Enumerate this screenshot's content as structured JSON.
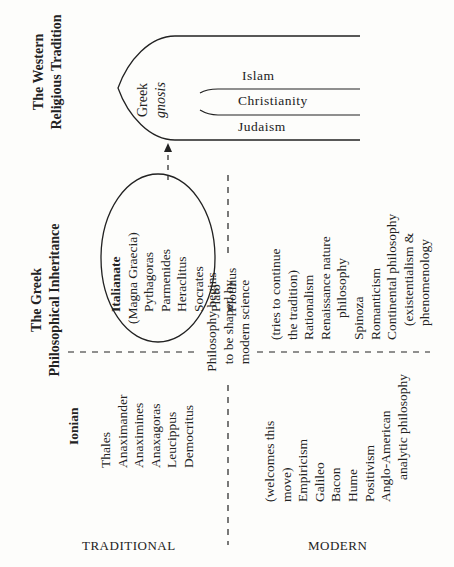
{
  "western": {
    "title_line1": "The Western",
    "title_line2": "Religious Tradition",
    "gnosis_line1": "Greek",
    "gnosis_line2": "gnosis",
    "religions": [
      "Islam",
      "Christianity",
      "Judaism"
    ]
  },
  "greek": {
    "title_line1": "The Greek",
    "title_line2": "Philosophical Inheritance",
    "italianate": {
      "heading": "Italianate",
      "subheading": "(Magna Graecia)",
      "names": [
        "Pythagoras",
        "Parmenides",
        "Heraclitus",
        "Socrates",
        "Plato",
        "Plotinus"
      ]
    },
    "ionian": {
      "heading": "Ionian",
      "names": [
        "Thales",
        "Anaximander",
        "Anaximines",
        "Anaxagoras",
        "Leucippus",
        "Democritus"
      ]
    }
  },
  "divider": {
    "line1": "Philosophy begins",
    "line2": "to be shaped by",
    "line3": "modern science"
  },
  "modern_continuing": {
    "lines": [
      "(tries to continue",
      "the tradition)",
      "Rationalism",
      "Renaissance nature",
      "philosophy",
      "Spinoza",
      "Romanticism",
      "Continental philosophy",
      "(existentialism &",
      "phenomenology"
    ]
  },
  "modern_welcoming": {
    "lines": [
      "(welcomes this",
      "move)",
      "Empiricism",
      "Galileo",
      "Bacon",
      "Hume",
      "Positivism",
      "Anglo-American",
      "analytic philosophy"
    ]
  },
  "axis_labels": {
    "traditional": "TRADITIONAL",
    "modern": "MODERN"
  }
}
